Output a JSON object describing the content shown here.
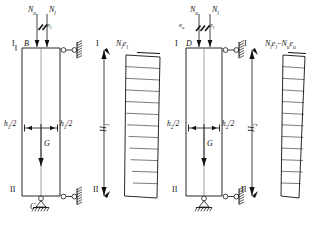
{
  "figure": {
    "type": "structural-engineering-diagram",
    "line_color": "#111111",
    "hatch_color": "#111111"
  },
  "left_figure": {
    "name": "figure-1",
    "loads": {
      "upper_axial": "N",
      "upper_axial_sub": "u",
      "lower_axial": "N",
      "lower_axial_sub": "l",
      "eccentricity_right": "e",
      "eccentricity_right_sub": "l"
    },
    "nodes": {
      "top_point": "B",
      "bottom_point": "C"
    },
    "sections": {
      "top_label": "I",
      "top_label_right": "I",
      "bottom_label": "II",
      "bottom_label_right": "II"
    },
    "dimensions": {
      "half_width_left": "h",
      "half_width_left_sub": "1",
      "half_width_left_suffix": "/2",
      "half_width_right": "h",
      "half_width_right_sub": "1",
      "half_width_right_suffix": "/2",
      "height": "H",
      "height_sub": "1"
    },
    "self_weight": "G",
    "moment_diagram": {
      "label_main": "N",
      "label_sub1": "l",
      "label_mid": "e",
      "label_sub2": "l",
      "shape": "triangular-tapering-downward",
      "hatch_lines": 12,
      "top_width_px": 46,
      "bottom_width_px": 2
    }
  },
  "right_figure": {
    "name": "figure-2",
    "loads": {
      "upper_axial": "N",
      "upper_axial_sub": "u",
      "lower_axial": "N",
      "lower_axial_sub": "l",
      "eccentricity_left": "e",
      "eccentricity_left_sub": "u",
      "eccentricity_right": "e",
      "eccentricity_right_sub": "l"
    },
    "nodes": {
      "top_point": "D"
    },
    "sections": {
      "top_label": "I",
      "top_label_right": "I",
      "bottom_label": "II",
      "bottom_label_right": "II"
    },
    "dimensions": {
      "half_width_left": "h",
      "half_width_left_sub": "2",
      "half_width_left_suffix": "/2",
      "half_width_right": "h",
      "half_width_right_sub": "2",
      "half_width_right_suffix": "/2",
      "height": "H",
      "height_sub": "2"
    },
    "self_weight": "G",
    "moment_diagram": {
      "label_t1": "N",
      "label_t1_sub": "l",
      "label_t2": "e",
      "label_t2_sub": "l",
      "label_minus": "−",
      "label_t3": "N",
      "label_t3_sub": "u",
      "label_t4": "e",
      "label_t4_sub": "u",
      "shape": "narrow-triangular-tapering-downward",
      "hatch_lines": 12,
      "top_width_px": 28,
      "bottom_width_px": 2
    }
  }
}
